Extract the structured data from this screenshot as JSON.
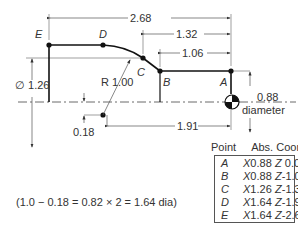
{
  "diagram": {
    "points": [
      {
        "name": "A",
        "x_label": "X",
        "x": "0.88",
        "z_label": "Z",
        "z": "0.00"
      },
      {
        "name": "B",
        "x_label": "X",
        "x": "0.88",
        "z_label": "Z",
        "z": "-1.06"
      },
      {
        "name": "C",
        "x_label": "X",
        "x": "1.26",
        "z_label": "Z",
        "z": "-1.32"
      },
      {
        "name": "D",
        "x_label": "X",
        "x": "1.64",
        "z_label": "Z",
        "z": "-1.91"
      },
      {
        "name": "E",
        "x_label": "X",
        "x": "1.64",
        "z_label": "Z",
        "z": "-2.68"
      }
    ],
    "dimensions": {
      "overall": "2.68",
      "c_to_a": "1.32",
      "b_to_a": "1.06",
      "arc_center": "1.91",
      "radius": "R 1.00",
      "diameter_c": "∅ 1.26",
      "offset": "0.18",
      "diameter_a": "0.88",
      "diameter_a_word": "diameter"
    },
    "table": {
      "col_point": "Point",
      "col_coord": "Abs. Coord."
    },
    "formula": "(1.0 − 0.18 = 0.82 × 2 = 1.64 dia)"
  }
}
